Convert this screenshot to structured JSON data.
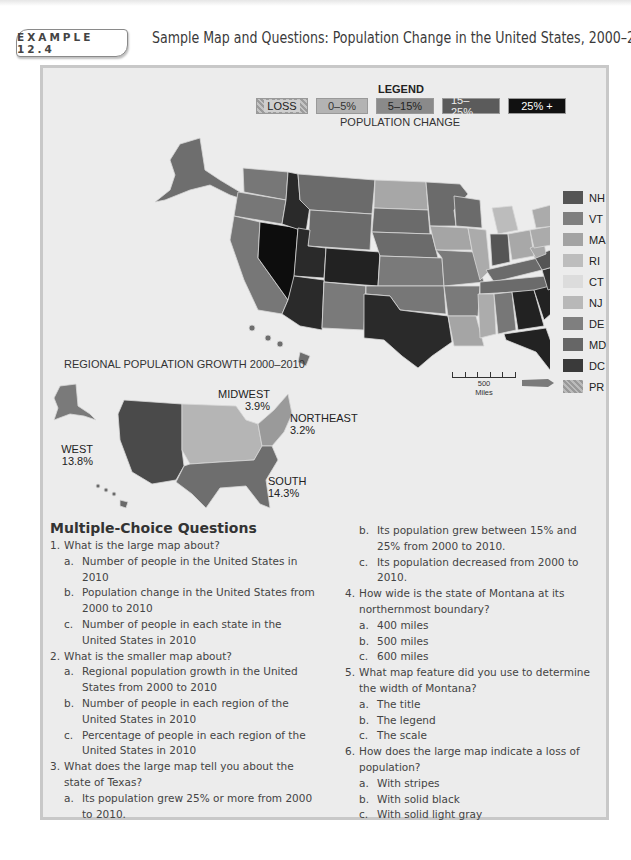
{
  "header": {
    "example_label": "EXAMPLE 12.4",
    "title": "Sample Map and Questions: Population Change in the United States, 2000–2010"
  },
  "legend": {
    "title": "LEGEND",
    "subtitle": "POPULATION CHANGE",
    "categories": [
      {
        "label": "LOSS",
        "style": "striped",
        "color": "#b0b0b0"
      },
      {
        "label": "0–5%",
        "color": "#b3b3b3"
      },
      {
        "label": "5–15%",
        "color": "#8a8a8a"
      },
      {
        "label": "15–25%",
        "color": "#5b5b5b"
      },
      {
        "label": "25% +",
        "color": "#111111"
      }
    ]
  },
  "state_legend": [
    {
      "label": "NH",
      "color": "#555555"
    },
    {
      "label": "VT",
      "color": "#7f7f7f"
    },
    {
      "label": "MA",
      "color": "#a3a3a3"
    },
    {
      "label": "RI",
      "color": "#bdbdbd"
    },
    {
      "label": "CT",
      "color": "#dcdcdc"
    },
    {
      "label": "NJ",
      "color": "#b8b8b8"
    },
    {
      "label": "DE",
      "color": "#7f7f7f"
    },
    {
      "label": "MD",
      "color": "#666666"
    },
    {
      "label": "DC",
      "color": "#3a3a3a"
    },
    {
      "label": "PR",
      "color": "#a8a8a8"
    }
  ],
  "scale": {
    "value": "500",
    "unit": "Miles"
  },
  "regional_map": {
    "title": "REGIONAL POPULATION GROWTH 2000–2010",
    "regions": [
      {
        "name": "WEST",
        "value": "13.8%"
      },
      {
        "name": "MIDWEST",
        "value": "3.9%"
      },
      {
        "name": "NORTHEAST",
        "value": "3.2%"
      },
      {
        "name": "SOUTH",
        "value": "14.3%"
      }
    ]
  },
  "questions": {
    "title": "Multiple-Choice Questions",
    "items": [
      {
        "num": "1.",
        "text": "What is the large map about?",
        "options": [
          {
            "letter": "a.",
            "text": "Number of people in the United States in 2010"
          },
          {
            "letter": "b.",
            "text": "Population change in the United States from 2000 to 2010"
          },
          {
            "letter": "c.",
            "text": "Number of people in each state in the United States in 2010"
          }
        ]
      },
      {
        "num": "2.",
        "text": "What is the smaller map about?",
        "options": [
          {
            "letter": "a.",
            "text": "Regional population growth in the United States from 2000 to 2010"
          },
          {
            "letter": "b.",
            "text": "Number of people in each region of the United States in 2010"
          },
          {
            "letter": "c.",
            "text": "Percentage of people in each region of the United States in 2010"
          }
        ]
      },
      {
        "num": "3.",
        "text": "What does the large map tell you about the state of Texas?",
        "options": [
          {
            "letter": "a.",
            "text": "Its population grew 25% or more from 2000 to 2010."
          },
          {
            "letter": "b.",
            "text": "Its population grew between 15% and 25% from 2000 to 2010."
          },
          {
            "letter": "c.",
            "text": "Its population decreased from 2000 to 2010."
          }
        ]
      },
      {
        "num": "4.",
        "text": "How wide is the state of Montana at its northernmost boundary?",
        "options": [
          {
            "letter": "a.",
            "text": "400 miles"
          },
          {
            "letter": "b.",
            "text": "500 miles"
          },
          {
            "letter": "c.",
            "text": "600 miles"
          }
        ]
      },
      {
        "num": "5.",
        "text": "What map feature did you use to determine the width of Montana?",
        "options": [
          {
            "letter": "a.",
            "text": "The title"
          },
          {
            "letter": "b.",
            "text": "The legend"
          },
          {
            "letter": "c.",
            "text": "The scale"
          }
        ]
      },
      {
        "num": "6.",
        "text": "How does the large map indicate a loss of population?",
        "options": [
          {
            "letter": "a.",
            "text": "With stripes"
          },
          {
            "letter": "b.",
            "text": "With solid black"
          },
          {
            "letter": "c.",
            "text": "With solid light gray"
          }
        ]
      }
    ]
  }
}
